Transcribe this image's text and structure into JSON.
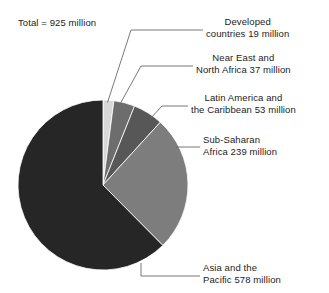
{
  "figure": {
    "total_label": "Total = 925 million"
  },
  "chart_data": {
    "type": "pie",
    "title": "",
    "total": 925,
    "unit": "million",
    "start_angle_deg": 0,
    "direction": "clockwise",
    "legend_position": "callouts-right",
    "grid": false,
    "categories": [
      "Developed countries",
      "Near East and North Africa",
      "Latin America and the Caribbean",
      "Sub-Saharan Africa",
      "Asia and the Pacific"
    ],
    "values": [
      19,
      37,
      53,
      239,
      578
    ],
    "colors": [
      "#d8d8d8",
      "#6d6d6d",
      "#575757",
      "#7d7d7d",
      "#262626"
    ],
    "slices": [
      {
        "name": "developed-countries",
        "value": 19,
        "label_line1": "Developed",
        "label_line2": "countries 19 million",
        "color": "#d8d8d8"
      },
      {
        "name": "near-east-north-africa",
        "value": 37,
        "label_line1": "Near East and",
        "label_line2": "North Africa 37 million",
        "color": "#6d6d6d"
      },
      {
        "name": "latin-america-caribbean",
        "value": 53,
        "label_line1": "Latin America and",
        "label_line2": "the Caribbean 53 million",
        "color": "#575757"
      },
      {
        "name": "sub-saharan-africa",
        "value": 239,
        "label_line1": "Sub-Saharan",
        "label_line2": "Africa 239 million",
        "color": "#7d7d7d"
      },
      {
        "name": "asia-and-the-pacific",
        "value": 578,
        "label_line1": "Asia and the",
        "label_line2": "Pacific 578 million",
        "color": "#262626"
      }
    ]
  }
}
